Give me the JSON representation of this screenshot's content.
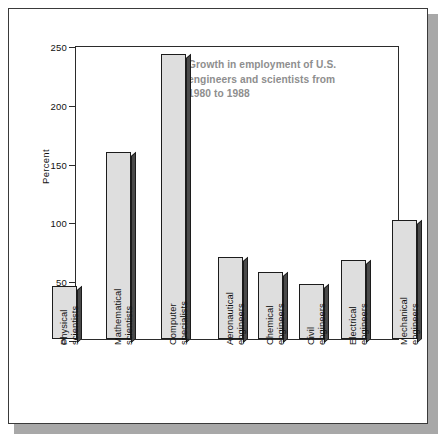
{
  "chart_data": {
    "type": "bar",
    "title": "Growth in employment of U.S. engineers and scientists from 1980 to 1988",
    "title_lines": [
      "Growth in employment of U.S.",
      "engineers and scientists from",
      "1980 to 1988"
    ],
    "xlabel": "",
    "ylabel": "Percent",
    "ylim": [
      0,
      250
    ],
    "ytick_values": [
      0,
      50,
      100,
      150,
      200,
      250
    ],
    "ytick_labels": [
      "0",
      "50",
      "100",
      "150",
      "200",
      "250"
    ],
    "grid": false,
    "legend": false,
    "categories": [
      "Physical scientists",
      "Mathematical scientists",
      "Computer specialists",
      "Aeronautical engineers",
      "Chemical engineers",
      "Civil engineers",
      "Electrical engineers",
      "Mechanical engineers"
    ],
    "category_lines": [
      [
        "Physical",
        "scientists"
      ],
      [
        "Mathematical",
        "scientists"
      ],
      [
        "Computer",
        "specialists"
      ],
      [
        "Aeronautical",
        "engineers"
      ],
      [
        "Chemical",
        "engineers"
      ],
      [
        "Civil",
        "engineers"
      ],
      [
        "Electrical",
        "engineers"
      ],
      [
        "Mechanical",
        "engineers"
      ]
    ],
    "values": [
      45,
      159,
      242,
      70,
      57,
      47,
      67,
      101
    ],
    "colors": {
      "bar_fill": "#dedede",
      "bar_outline": "#1c1c1c",
      "bar_side": "#4a4a4a",
      "axis": "#2b2b2b",
      "title_text": "#8e8e8e",
      "tick_text": "#111111",
      "page_background": "#ffffff",
      "frame_border": "#3a3a3a",
      "frame_shadow": "#a8a8a8"
    }
  }
}
